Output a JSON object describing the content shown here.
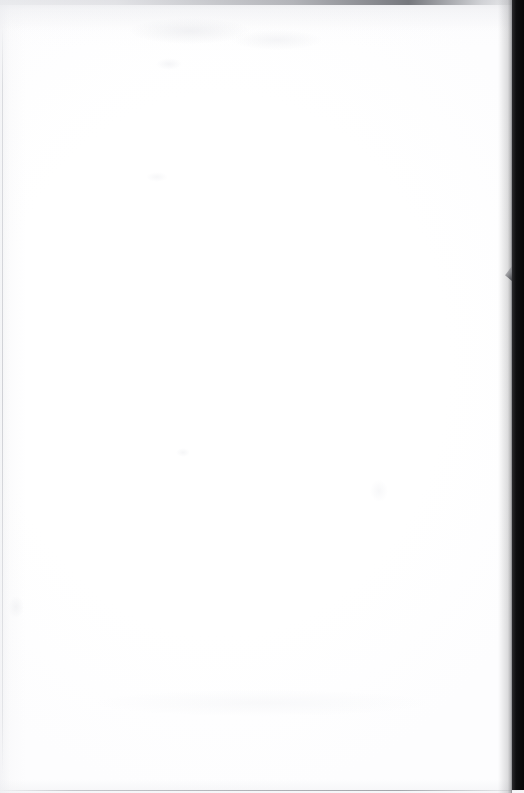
{
  "document": {
    "kind": "scanned-page",
    "page_content": "",
    "page_number": "",
    "header_text": "",
    "footer_text": "",
    "visible_text_blocks": []
  },
  "artifacts": {
    "right_gutter_label": "",
    "top_shadow_label": "",
    "notch_label": ""
  },
  "colors": {
    "paper": "#ffffff",
    "gutter_dark": "#0e0e10",
    "gutter_edge": "#2b2b2e",
    "edge_hairline": "#bcbec4",
    "top_shadow": "#62666a",
    "notch_gray": "#76777c"
  }
}
